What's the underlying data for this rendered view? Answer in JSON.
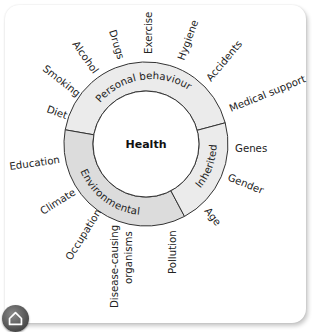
{
  "diagram": {
    "center": {
      "label": "Health"
    },
    "segments": [
      {
        "label": "Personal behaviour",
        "color": "#ebebeb"
      },
      {
        "label": "Environmental",
        "color": "#dcdcdc"
      },
      {
        "label": "Inherited",
        "color": "#ebebeb"
      }
    ],
    "factors": {
      "personal_behaviour": [
        "Diet",
        "Smoking",
        "Alcohol",
        "Drugs",
        "Exercise",
        "Hygiene",
        "Accidents",
        "Medical support"
      ],
      "environmental": [
        "Education",
        "Climate",
        "Occupation",
        "Disease-causing",
        "organisms",
        "Pollution"
      ],
      "inherited": [
        "Genes",
        "Gender",
        "Age"
      ]
    }
  },
  "nav": {
    "home_icon": "home-icon"
  },
  "colors": {
    "ring_stroke": "#333333",
    "ring_fill_light": "#ebebeb",
    "ring_fill_dark": "#dcdcdc",
    "home_button": "#555555"
  }
}
